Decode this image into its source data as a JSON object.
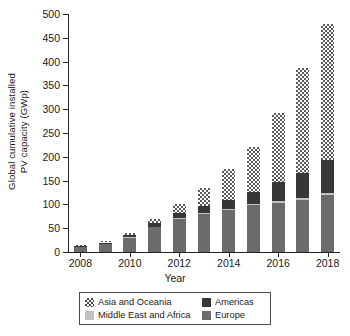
{
  "chart_data": {
    "type": "bar",
    "subtype": "stacked-bar",
    "title": "",
    "xlabel": "Year",
    "ylabel": "Global cumulative installed PV capacity (GWp)",
    "ylabel_line1": "Global cumulative installed",
    "ylabel_line2": "PV capacity (GWp)",
    "ylim": [
      0,
      500
    ],
    "ytick_step": 50,
    "yticks": [
      0,
      50,
      100,
      150,
      200,
      250,
      300,
      350,
      400,
      450,
      500
    ],
    "ytick_labels": [
      "0",
      "50",
      "100",
      "150",
      "200",
      "250",
      "300",
      "350",
      "400",
      "450",
      "500"
    ],
    "categories": [
      2008,
      2009,
      2010,
      2011,
      2012,
      2013,
      2014,
      2015,
      2016,
      2017,
      2018
    ],
    "xtick_labels": [
      "2008",
      "2010",
      "2012",
      "2014",
      "2016",
      "2018"
    ],
    "xtick_categories": [
      2008,
      2010,
      2012,
      2014,
      2016,
      2018
    ],
    "grid": false,
    "legend_position": "bottom",
    "stack_order_bottom_to_top": [
      "Europe",
      "Middle East and Africa",
      "Americas",
      "Asia and Oceania"
    ],
    "series": [
      {
        "name": "Europe",
        "key": "europe",
        "color": "#6b6b6b",
        "pattern": "solid-medium-gray",
        "values": [
          11,
          17,
          30,
          52,
          70,
          80,
          88,
          98,
          104,
          110,
          120
        ]
      },
      {
        "name": "Middle East and Africa",
        "key": "mea",
        "color": "#c2c2c2",
        "pattern": "solid-light-gray",
        "values": [
          0,
          0,
          1,
          1,
          2,
          2,
          2,
          3,
          4,
          4,
          5
        ]
      },
      {
        "name": "Americas",
        "key": "amer",
        "color": "#373737",
        "pattern": "solid-dark",
        "values": [
          2,
          3,
          4,
          7,
          11,
          14,
          20,
          25,
          40,
          53,
          68
        ]
      },
      {
        "name": "Asia and Oceania",
        "key": "asia",
        "color": "#5a5a5a",
        "pattern": "checkerboard",
        "values": [
          2,
          2,
          5,
          10,
          17,
          39,
          64,
          94,
          145,
          220,
          287
        ]
      }
    ],
    "totals": [
      15,
      22,
      40,
      70,
      100,
      135,
      174,
      220,
      293,
      387,
      480
    ],
    "legend_entries": [
      {
        "label": "Asia and Oceania",
        "key": "asia"
      },
      {
        "label": "Americas",
        "key": "amer"
      },
      {
        "label": "Middle East and Africa",
        "key": "mea"
      },
      {
        "label": "Europe",
        "key": "europe"
      }
    ]
  }
}
